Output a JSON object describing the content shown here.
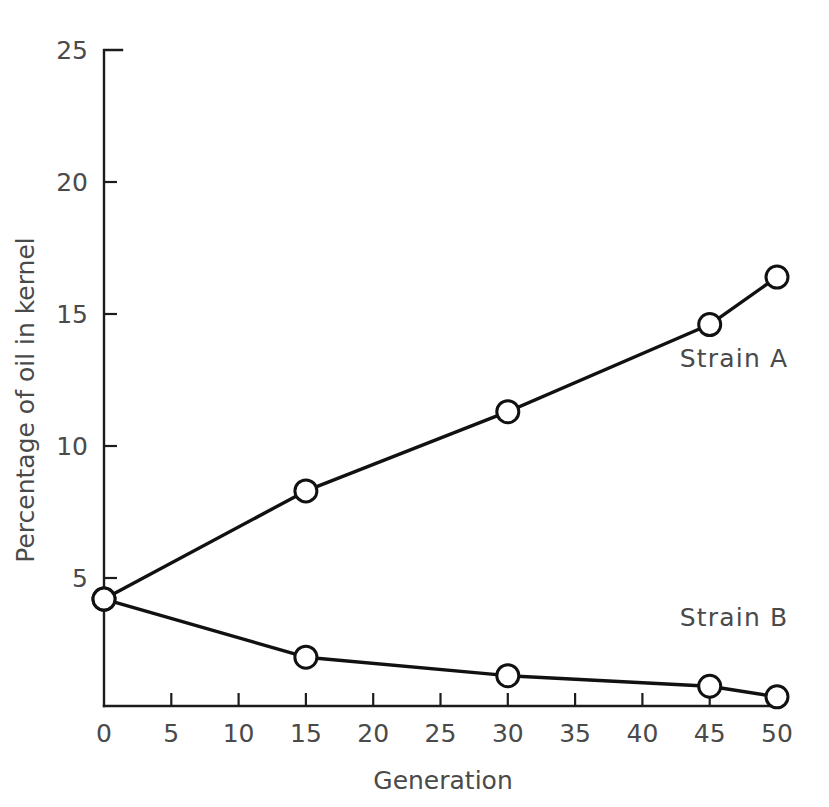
{
  "chart_data": {
    "type": "line",
    "title": "",
    "xlabel": "Generation",
    "ylabel": "Percentage of oil in kernel",
    "xlim": [
      0,
      50
    ],
    "ylim": [
      0,
      25
    ],
    "xticks": [
      0,
      5,
      10,
      15,
      20,
      25,
      30,
      35,
      40,
      45,
      50
    ],
    "xtick_labels": [
      "0",
      "5",
      "10",
      "15",
      "20",
      "25",
      "30",
      "35",
      "40",
      "45",
      "50"
    ],
    "yticks": [
      5,
      10,
      15,
      20,
      25
    ],
    "ytick_labels": [
      "5",
      "10",
      "15",
      "20",
      "25"
    ],
    "grid": false,
    "legend_position": "inline-right",
    "marker": "open-circle",
    "line_color": "#111111",
    "marker_fill": "#ffffff",
    "axis_color": "#1c1c1c",
    "text_color": "#4a4a4a",
    "x": [
      0,
      15,
      30,
      45,
      50
    ],
    "series": [
      {
        "name": "Strain A",
        "label": "Strain A",
        "values": [
          4.2,
          8.3,
          11.3,
          14.6,
          16.4
        ]
      },
      {
        "name": "Strain B",
        "label": "Strain B",
        "values": [
          4.2,
          2.0,
          1.3,
          0.9,
          0.5
        ]
      }
    ],
    "annotations": [
      {
        "text": "Strain A",
        "x": 45,
        "y": 13.0
      },
      {
        "text": "Strain B",
        "x": 45,
        "y": 3.2
      }
    ]
  }
}
